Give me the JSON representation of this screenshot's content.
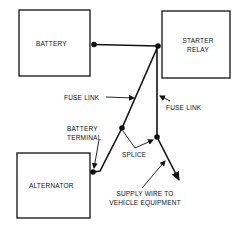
{
  "diagram": {
    "components": {
      "battery": "BATTERY",
      "starter_relay_line1": "STARTER",
      "starter_relay_line2": "RELAY",
      "alternator": "ALTERNATOR"
    },
    "labels": {
      "fuse_link_left": "FUSE LINK",
      "fuse_link_right": "FUSE LINK",
      "battery_terminal_line1": "BATTERY",
      "battery_terminal_line2": "TERMINAL",
      "splice": "SPLICE",
      "supply_wire_line1": "SUPPLY WIRE TO",
      "supply_wire_line2": "VEHICLE EQUIPMENT"
    },
    "colors": {
      "line": "#111111",
      "background": "#ffffff"
    }
  }
}
